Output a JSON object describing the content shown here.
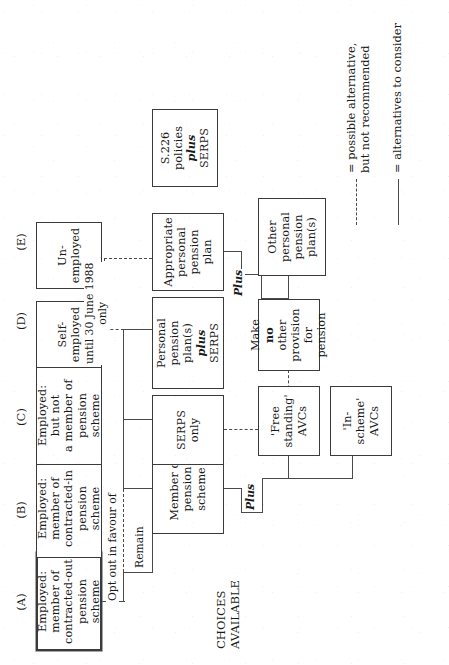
{
  "diagram": {
    "orientation": "rotated-90-counterclockwise",
    "row_labels": {
      "present_category": "PRESENT\nCATEGORY",
      "choices_available": "CHOICES\nAVAILABLE"
    },
    "category_letters": {
      "a": "(A)",
      "b": "(B)",
      "c": "(C)",
      "d": "(D)",
      "e": "(E)"
    },
    "present_category_boxes": {
      "a": "Employed:\nmember of\ncontracted-out\npension scheme",
      "b": "Employed:\nmember of\ncontracted-in\npension scheme",
      "c": "Employed:\nbut not\na member of\npension scheme",
      "d": "Self-\nemployed",
      "e": "Un-\nemployed"
    },
    "choice_boxes": {
      "member_of_pension_scheme": "Member of\npension scheme",
      "serps_only": "SERPS\nonly",
      "personal_pension_plus_serps_l1": "Personal",
      "personal_pension_plus_serps_l2": "pension plan(s)",
      "personal_pension_plus_serps_l3": "plus",
      "personal_pension_plus_serps_l4": "SERPS",
      "appropriate_personal_pension_plan": "Appropriate\npersonal\npension\nplan",
      "s226_l1": "S.226",
      "s226_l2": "policies",
      "s226_l3_emph": "plus",
      "s226_l3_rest": " SERPS"
    },
    "secondary_boxes": {
      "in_scheme_avcs": "'In-scheme'\nAVCs",
      "free_standing_avcs": "'Free\nstanding'\nAVCs",
      "make_no_other_provision_l1": "Make ",
      "make_no_other_provision_emph": "no",
      "make_no_other_provision_l2": "other\nprovision\nfor pension",
      "other_personal_pension_plans": "Other\npersonal\npension\nplan(s)"
    },
    "edge_labels": {
      "opt_out": "Opt out in favour of",
      "remain": "Remain",
      "plus_avc": "Plus",
      "plus_other_ppp": "Plus",
      "until_1988": "until 30 June 1988\nonly"
    },
    "legend": {
      "solid_text": "= alternatives to consider",
      "dashed_text": "= possible alternative,\n   but not recommended"
    },
    "colors": {
      "ink": "#1a1a1a",
      "line": "#4a4a4a",
      "border": "#3b3b3b",
      "paper": "#ffffff"
    }
  }
}
